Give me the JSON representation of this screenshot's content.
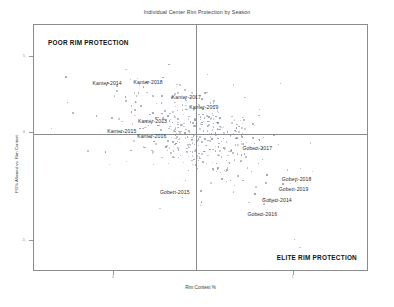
{
  "chart_data": {
    "type": "scatter",
    "title": "Individual Center Rim Protection by Season",
    "xlabel": "Rim Contest %",
    "ylabel": "FG% Allowed vs. Rim Contest",
    "grid": false,
    "legend": null,
    "xlim": [
      0,
      100
    ],
    "ylim": [
      0,
      100
    ],
    "quadrant_divider_x": 48.4,
    "quadrant_divider_y": 55.9,
    "annotations": [
      {
        "text": "POOR RIM PROTECTION",
        "position": "top-left",
        "style": "bold"
      },
      {
        "text": "ELITE RIM PROTECTION",
        "position": "bottom-right",
        "style": "bold"
      }
    ],
    "xticks": [
      {
        "value": 24,
        "label": "0"
      },
      {
        "value": 78,
        "label": "1"
      }
    ],
    "yticks": [
      {
        "value": 87,
        "label": "5"
      },
      {
        "value": 56,
        "label": "0"
      },
      {
        "value": 12,
        "label": "-5"
      }
    ],
    "labeled_points": [
      {
        "label": "Kanter-2014",
        "x": 21.5,
        "y": 75.8
      },
      {
        "label": "Kanter-2018",
        "x": 33.8,
        "y": 76.4
      },
      {
        "label": "Kanter-2017",
        "x": 45.3,
        "y": 70.1
      },
      {
        "label": "Kanter-2019",
        "x": 50.5,
        "y": 66.0
      },
      {
        "label": "Kanter-2013",
        "x": 35.1,
        "y": 60.4
      },
      {
        "label": "Kanter-2015",
        "x": 25.9,
        "y": 56.5
      },
      {
        "label": "Kanter-2016",
        "x": 34.9,
        "y": 54.4
      },
      {
        "label": "Gobert-2017",
        "x": 66.5,
        "y": 49.5
      },
      {
        "label": "Gobert-2018",
        "x": 78.3,
        "y": 36.6
      },
      {
        "label": "Gobert-2019",
        "x": 77.4,
        "y": 32.8
      },
      {
        "label": "Gobert-2014",
        "x": 72.4,
        "y": 28.2
      },
      {
        "label": "Gobert-2016",
        "x": 68.0,
        "y": 22.5
      },
      {
        "label": "Gobert-2015",
        "x": 41.7,
        "y": 31.6
      }
    ],
    "point_color": "#7d8694",
    "frame_color": "#8c8c8c",
    "background": "#ffffff",
    "n_points_approx": 420
  }
}
